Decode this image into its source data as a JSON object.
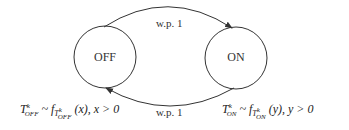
{
  "diagram": {
    "type": "state-transition",
    "states": [
      {
        "id": "off",
        "label": "OFF"
      },
      {
        "id": "on",
        "label": "ON"
      }
    ],
    "transitions": [
      {
        "from": "off",
        "to": "on",
        "label": "w.p. 1",
        "position": "top"
      },
      {
        "from": "on",
        "to": "off",
        "label": "w.p. 1",
        "position": "bottom"
      }
    ],
    "annotations": {
      "off": {
        "T": "T",
        "sup": "k",
        "sub": "OFF",
        "dist": "~ f",
        "dist_sub": "T",
        "dist_sub_sup": "k",
        "dist_sub_sub": "OFF",
        "rest": "(x), x > 0"
      },
      "on": {
        "T": "T",
        "sup": "k",
        "sub": "ON",
        "dist": "~ f",
        "dist_sub": "T",
        "dist_sub_sup": "k",
        "dist_sub_sub": "ON",
        "rest": "(y), y > 0"
      }
    },
    "colors": {
      "stroke": "#333333",
      "background": "#ffffff"
    }
  }
}
